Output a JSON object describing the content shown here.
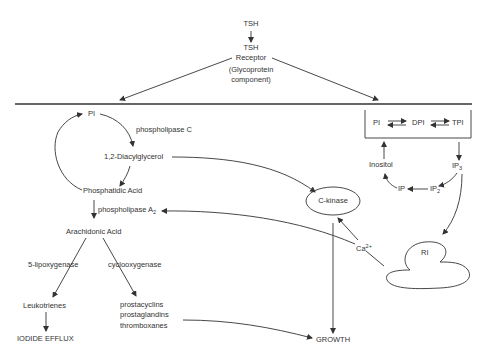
{
  "top": {
    "tsh": "TSH",
    "receptor_line1": "TSH",
    "receptor_line2": "Receptor",
    "receptor_line3": "(Glycoprotein",
    "receptor_line4": "component)"
  },
  "left_pathway": {
    "pi": "PI",
    "phospholipase_c": "phospholipase C",
    "diacylglycerol": "1,2-Diacylglycerol",
    "phosphatidic_acid": "Phosphatidic Acid",
    "phospholipase_a": "phospholipase A",
    "phospholipase_a_sub": "2",
    "arachidonic_acid": "Arachidonic Acid",
    "lipoxygenase": "5-lipoxygenase",
    "cyclooxygenase": "cyclooxygenase",
    "leukotrienes": "Leukotrienes",
    "iodide_efflux": "IODIDE EFFLUX",
    "prostacyclins": "prostacyclins",
    "prostaglandins": "prostaglandins",
    "thromboxanes": "thromboxanes"
  },
  "center": {
    "c_kinase": "C-kinase",
    "ca": "Ca",
    "ca_sup": "2+",
    "growth": "GROWTH"
  },
  "right_pathway": {
    "pi": "PI",
    "dpi": "DPI",
    "tpi": "TPI",
    "inositol": "Inositol",
    "ip3": "IP",
    "ip3_sub": "3",
    "ip2": "IP",
    "ip2_sub": "2",
    "ip": "IP",
    "ri": "RI"
  }
}
